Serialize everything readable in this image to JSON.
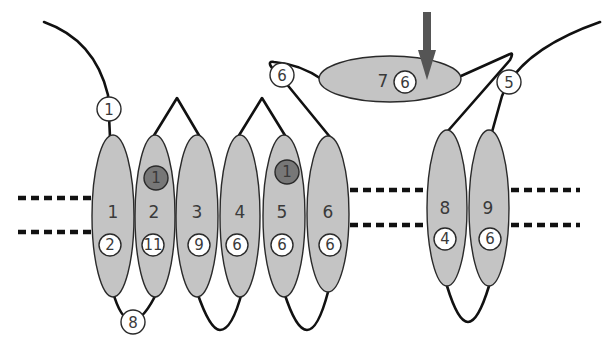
{
  "diagram": {
    "type": "membrane-protein-topology",
    "colors": {
      "helix_fill": "#c4c4c4",
      "outline": "#2a2a2a",
      "loop": "#111111",
      "dark_badge": "#777777",
      "arrow": "#555555"
    },
    "helices": [
      {
        "id": "1",
        "label": "1",
        "badge": "2"
      },
      {
        "id": "2",
        "label": "2",
        "badge": "11",
        "top_badge": "1"
      },
      {
        "id": "3",
        "label": "3",
        "badge": "9"
      },
      {
        "id": "4",
        "label": "4",
        "badge": "6"
      },
      {
        "id": "5",
        "label": "5",
        "badge": "6",
        "top_badge": "1"
      },
      {
        "id": "6",
        "label": "6",
        "badge": "6"
      },
      {
        "id": "8",
        "label": "8",
        "badge": "4"
      },
      {
        "id": "9",
        "label": "9",
        "badge": "6"
      }
    ],
    "domain7": {
      "label": "7",
      "badge": "6"
    },
    "loop_badges": {
      "n_terminus": "1",
      "loop_1_2": "8",
      "loop_6_7": "6",
      "c_terminus": "5"
    },
    "arrow": {
      "direction": "down",
      "target": "domain-7"
    }
  }
}
